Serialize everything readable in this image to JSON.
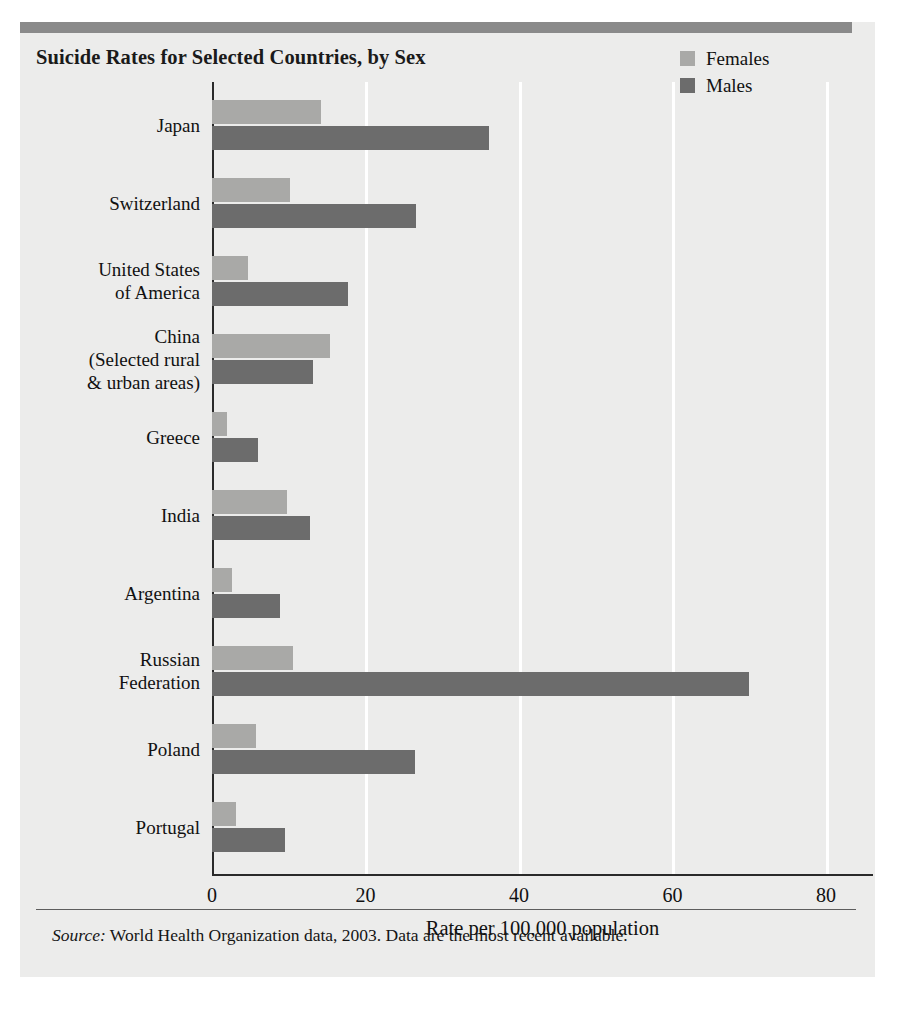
{
  "figure": {
    "title": "Suicide Rates for Selected Countries, by Sex",
    "source_label": "Source:",
    "source_text": " World Health Organization data, 2003. Data are the most recent available."
  },
  "colors": {
    "females": "#a9a9a7",
    "males": "#6c6c6c",
    "panel_background": "#ececeb",
    "top_rule": "#8a8a8a",
    "axis": "#2a2a2a",
    "gridline": "#ffffff"
  },
  "chart_data": {
    "type": "bar",
    "orientation": "horizontal",
    "title": "Suicide Rates for Selected Countries, by Sex",
    "xlabel": "Rate per 100,000 population",
    "ylabel": "",
    "xlim": [
      0,
      86
    ],
    "xticks": [
      0,
      20,
      40,
      60,
      80
    ],
    "xticklabels": [
      "0",
      "20",
      "40",
      "60",
      "80"
    ],
    "grid": "vertical",
    "legend_position": "top-right",
    "categories": [
      "Japan",
      "Switzerland",
      "United States\nof America",
      "China\n(Selected rural\n& urban areas)",
      "Greece",
      "India",
      "Argentina",
      "Russian\nFederation",
      "Poland",
      "Portugal"
    ],
    "series": [
      {
        "name": "Females",
        "color": "#a9a9a7",
        "values": [
          14.2,
          10.2,
          4.7,
          15.4,
          2.0,
          9.8,
          2.6,
          10.6,
          5.7,
          3.1
        ]
      },
      {
        "name": "Males",
        "color": "#6c6c6c",
        "values": [
          36.1,
          26.6,
          17.7,
          13.2,
          6.0,
          12.8,
          8.9,
          70.0,
          26.4,
          9.5
        ]
      }
    ]
  }
}
